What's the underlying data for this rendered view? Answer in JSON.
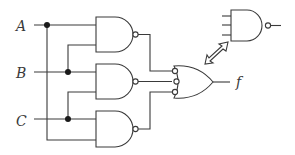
{
  "diagram": {
    "type": "logic-circuit",
    "inputs": [
      {
        "label": "A"
      },
      {
        "label": "B"
      },
      {
        "label": "C"
      }
    ],
    "output": {
      "label": "f"
    },
    "gates": [
      {
        "id": "nand1",
        "type": "NAND",
        "inputs": [
          "A",
          "B"
        ]
      },
      {
        "id": "nand2",
        "type": "NAND",
        "inputs": [
          "B",
          "C"
        ]
      },
      {
        "id": "nand3",
        "type": "NAND",
        "inputs": [
          "C",
          "A"
        ]
      },
      {
        "id": "or_neg",
        "type": "OR with inverted inputs",
        "inputs": [
          "nand1",
          "nand2",
          "nand3"
        ],
        "output": "f"
      }
    ],
    "equivalent_symbol": {
      "type": "3-input NAND",
      "relation": "equivalent (double arrow)"
    },
    "colors": {
      "stroke": "#3a3a3a",
      "junction": "#1a1a1a",
      "background": "#ffffff"
    }
  }
}
